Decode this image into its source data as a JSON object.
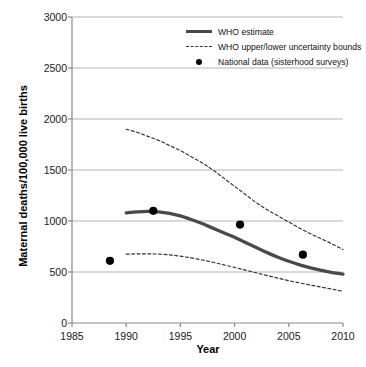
{
  "chart_data": {
    "type": "line",
    "title": "",
    "xlabel": "Year",
    "ylabel": "Maternal deaths/100,000 live births",
    "xlim": [
      1985,
      2010
    ],
    "ylim": [
      0,
      3000
    ],
    "xticks": [
      1985,
      1990,
      1995,
      2000,
      2005,
      2010
    ],
    "xtick_labels": [
      "1985",
      "1990",
      "1995",
      "2000",
      "2005",
      "2010"
    ],
    "yticks": [
      0,
      500,
      1000,
      1500,
      2000,
      2500,
      3000
    ],
    "ytick_labels": [
      "0",
      "500",
      "1000",
      "1500",
      "2000",
      "2500",
      "3000"
    ],
    "grid": "horizontal",
    "legend_position": "top-right",
    "series": [
      {
        "name": "WHO estimate",
        "style": "solid-thick",
        "color": "#4a4a4a",
        "x": [
          1990,
          1991,
          1992,
          1993,
          1994,
          1995,
          1996,
          1997,
          1998,
          1999,
          2000,
          2001,
          2002,
          2003,
          2004,
          2005,
          2006,
          2007,
          2008,
          2009,
          2010
        ],
        "values": [
          1080,
          1090,
          1095,
          1090,
          1075,
          1050,
          1015,
          975,
          930,
          885,
          840,
          790,
          740,
          690,
          645,
          605,
          570,
          540,
          515,
          495,
          480
        ]
      },
      {
        "name": "WHO upper uncertainty bound",
        "style": "dashed",
        "color": "#333333",
        "x": [
          1990,
          1991,
          1992,
          1993,
          1994,
          1995,
          1996,
          1997,
          1998,
          1999,
          2000,
          2001,
          2002,
          2003,
          2004,
          2005,
          2006,
          2007,
          2008,
          2009,
          2010
        ],
        "values": [
          1900,
          1870,
          1830,
          1790,
          1740,
          1690,
          1630,
          1570,
          1500,
          1420,
          1340,
          1260,
          1180,
          1110,
          1050,
          990,
          930,
          875,
          825,
          775,
          720
        ]
      },
      {
        "name": "WHO lower uncertainty bound",
        "style": "dashed",
        "color": "#333333",
        "x": [
          1990,
          1991,
          1992,
          1993,
          1994,
          1995,
          1996,
          1997,
          1998,
          1999,
          2000,
          2001,
          2002,
          2003,
          2004,
          2005,
          2006,
          2007,
          2008,
          2009,
          2010
        ],
        "values": [
          675,
          678,
          678,
          675,
          668,
          655,
          638,
          618,
          595,
          570,
          545,
          518,
          492,
          465,
          440,
          415,
          393,
          372,
          352,
          332,
          310
        ]
      },
      {
        "name": "National data (sisterhood surveys)",
        "style": "points",
        "color": "#000000",
        "x": [
          1988.5,
          1992.5,
          2000.5,
          2006.3
        ],
        "values": [
          610,
          1100,
          965,
          670
        ]
      }
    ]
  },
  "legend": {
    "items": [
      {
        "label": "WHO estimate",
        "marker": "solid-line"
      },
      {
        "label": "WHO upper/lower uncertainty bounds",
        "marker": "dashed-line"
      },
      {
        "label": "National data (sisterhood surveys)",
        "marker": "filled-circle"
      }
    ]
  },
  "axes": {
    "x_title": "Year",
    "y_title": "Maternal deaths/100,000 live births"
  },
  "colors": {
    "who_estimate": "#4a4a4a",
    "bounds": "#333333",
    "points": "#000000",
    "gridline": "#b4b4b4",
    "axis": "#8a8a8a",
    "text": "#111111"
  }
}
